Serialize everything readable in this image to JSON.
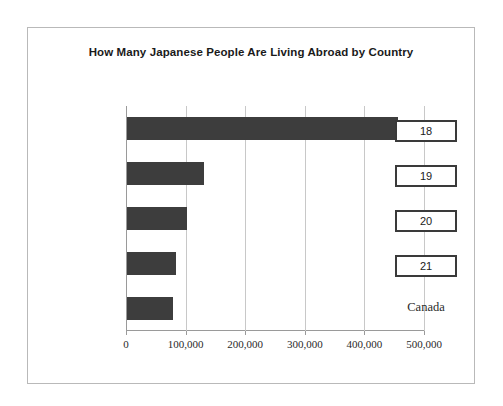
{
  "chart_data": {
    "type": "bar",
    "orientation": "horizontal",
    "title": "How Many Japanese People Are Living Abroad by Country",
    "xlabel": "",
    "ylabel": "",
    "categories": [
      "18",
      "19",
      "20",
      "21",
      "Canada"
    ],
    "category_styles": [
      "boxed",
      "boxed",
      "boxed",
      "boxed",
      "plain"
    ],
    "values": [
      455000,
      129000,
      100000,
      82000,
      78000
    ],
    "xlim": [
      0,
      500000
    ],
    "xticks": [
      0,
      100000,
      200000,
      300000,
      400000,
      500000
    ],
    "xtick_labels": [
      "0",
      "100,000",
      "200,000",
      "300,000",
      "400,000",
      "500,000"
    ],
    "grid": true,
    "grid_axis": "x",
    "legend": false,
    "bar_color": "#3d3d3d",
    "grid_color": "#c8c8c8",
    "axis_color": "#9a9a9a",
    "frame_color": "#b9b9b9",
    "background": "#ffffff"
  }
}
